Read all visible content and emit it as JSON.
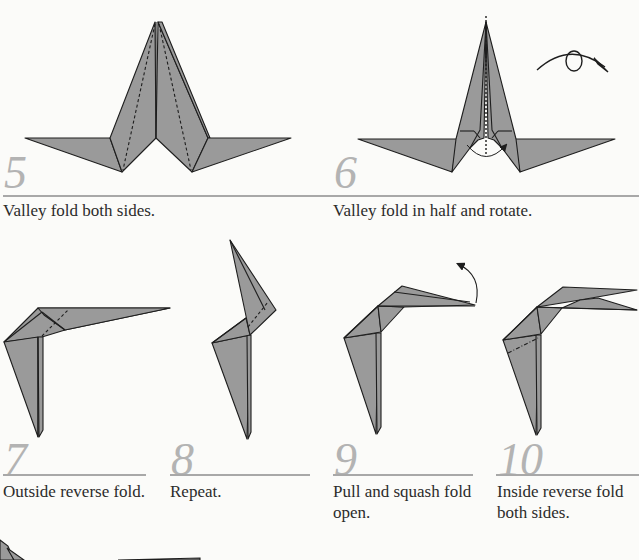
{
  "page": {
    "type": "origami instruction sheet",
    "paper_fill": "#9a9a9a",
    "line_color": "#1e1e1e",
    "number_color": "#b3b3b3",
    "rule_color": "#a8a8a8"
  },
  "steps": [
    {
      "number": "5",
      "caption": "Valley fold both sides."
    },
    {
      "number": "6",
      "caption": "Valley fold in half and rotate."
    },
    {
      "number": "7",
      "caption": "Outside reverse fold."
    },
    {
      "number": "8",
      "caption": "Repeat."
    },
    {
      "number": "9",
      "caption": "Pull and squash fold open."
    },
    {
      "number": "10",
      "caption": "Inside reverse fold both sides."
    }
  ],
  "captions_wrapped": {
    "step9": [
      "Pull and squash fold",
      "open."
    ],
    "step10": [
      "Inside reverse fold",
      "both sides."
    ]
  },
  "icons": {
    "rotate_symbol": "rotate-arrow-icon",
    "pull_arrow": "curved-arrow-icon",
    "valley_arrow": "valley-fold-arrow-icon"
  }
}
